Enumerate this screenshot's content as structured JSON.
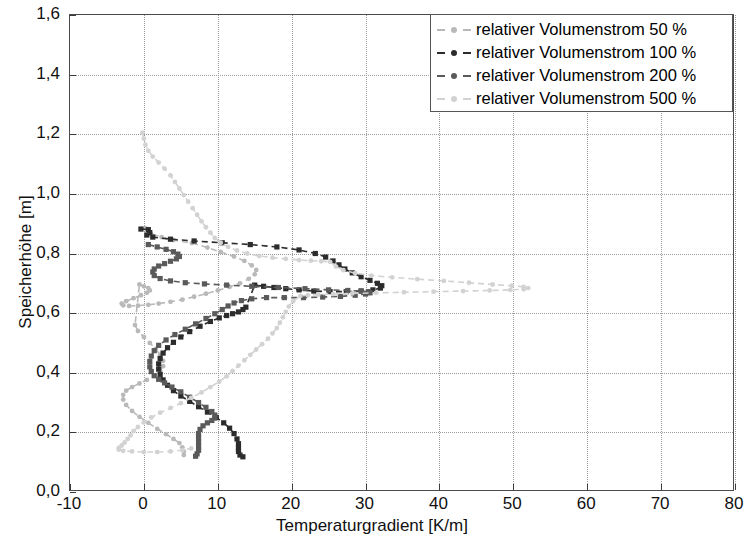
{
  "chart_data": {
    "type": "line",
    "title": "",
    "xlabel": "Temperaturgradient [K/m]",
    "ylabel": "Speicherhöhe [m]",
    "xlim": [
      -10,
      80
    ],
    "ylim": [
      0.0,
      1.6
    ],
    "xticks": [
      "-10",
      "0",
      "10",
      "20",
      "30",
      "40",
      "50",
      "60",
      "70",
      "80"
    ],
    "xtick_values": [
      -10,
      0,
      10,
      20,
      30,
      40,
      50,
      60,
      70,
      80
    ],
    "yticks": [
      "0,0",
      "0,2",
      "0,4",
      "0,6",
      "0,8",
      "1,0",
      "1,2",
      "1,4",
      "1,6"
    ],
    "ytick_values": [
      0.0,
      0.2,
      0.4,
      0.6,
      0.8,
      1.0,
      1.2,
      1.4,
      1.6
    ],
    "grid": true,
    "grid_style": "dotted",
    "legend_position": "top-right",
    "orientation": "x=temperature-gradient, y=storage-height",
    "series": [
      {
        "name": "relativer Volumenstrom 50 %",
        "color": "#b9b9b9",
        "marker": "dot",
        "linestyle": "dashed",
        "points": [
          [
            0.2,
            0.885
          ],
          [
            1.0,
            0.865
          ],
          [
            2.4,
            0.855
          ],
          [
            4.0,
            0.845
          ],
          [
            6.5,
            0.835
          ],
          [
            8.6,
            0.82
          ],
          [
            10.4,
            0.805
          ],
          [
            12.2,
            0.79
          ],
          [
            13.6,
            0.775
          ],
          [
            14.6,
            0.76
          ],
          [
            15.2,
            0.745
          ],
          [
            15.0,
            0.73
          ],
          [
            14.2,
            0.715
          ],
          [
            13.0,
            0.7
          ],
          [
            11.6,
            0.688
          ],
          [
            10.0,
            0.676
          ],
          [
            8.4,
            0.665
          ],
          [
            6.8,
            0.655
          ],
          [
            5.2,
            0.645
          ],
          [
            3.6,
            0.638
          ],
          [
            2.0,
            0.632
          ],
          [
            0.6,
            0.628
          ],
          [
            -0.8,
            0.625
          ],
          [
            -2.0,
            0.624
          ],
          [
            -2.8,
            0.626
          ],
          [
            -3.0,
            0.632
          ],
          [
            -2.4,
            0.64
          ],
          [
            -1.4,
            0.65
          ],
          [
            -0.4,
            0.66
          ],
          [
            0.4,
            0.668
          ],
          [
            0.8,
            0.676
          ],
          [
            0.6,
            0.684
          ],
          [
            0.0,
            0.69
          ],
          [
            -0.6,
            0.696
          ],
          [
            -1.2,
            0.56
          ],
          [
            -0.8,
            0.54
          ],
          [
            0.0,
            0.52
          ],
          [
            0.8,
            0.5
          ],
          [
            1.6,
            0.48
          ],
          [
            2.2,
            0.46
          ],
          [
            2.6,
            0.44
          ],
          [
            2.6,
            0.422
          ],
          [
            2.2,
            0.405
          ],
          [
            1.4,
            0.39
          ],
          [
            0.4,
            0.376
          ],
          [
            -0.6,
            0.364
          ],
          [
            -1.6,
            0.352
          ],
          [
            -2.4,
            0.34
          ],
          [
            -2.8,
            0.326
          ],
          [
            -2.8,
            0.31
          ],
          [
            -2.4,
            0.292
          ],
          [
            -1.6,
            0.272
          ],
          [
            -0.6,
            0.252
          ],
          [
            0.6,
            0.232
          ],
          [
            1.8,
            0.212
          ],
          [
            3.0,
            0.194
          ],
          [
            4.0,
            0.178
          ],
          [
            4.8,
            0.164
          ],
          [
            5.2,
            0.15
          ],
          [
            5.4,
            0.136
          ],
          [
            5.4,
            0.124
          ]
        ]
      },
      {
        "name": "relativer Volumenstrom 100 %",
        "color": "#2c2c2c",
        "marker": "square",
        "linestyle": "dashed",
        "points": [
          [
            -0.4,
            0.882
          ],
          [
            0.6,
            0.88
          ],
          [
            0.8,
            0.87
          ],
          [
            0.4,
            0.862
          ],
          [
            1.2,
            0.855
          ],
          [
            3.6,
            0.848
          ],
          [
            6.8,
            0.842
          ],
          [
            10.6,
            0.836
          ],
          [
            14.4,
            0.83
          ],
          [
            18.0,
            0.822
          ],
          [
            21.0,
            0.812
          ],
          [
            23.2,
            0.8
          ],
          [
            24.6,
            0.788
          ],
          [
            25.6,
            0.775
          ],
          [
            26.4,
            0.762
          ],
          [
            27.2,
            0.748
          ],
          [
            28.2,
            0.735
          ],
          [
            29.4,
            0.722
          ],
          [
            30.6,
            0.71
          ],
          [
            31.6,
            0.7
          ],
          [
            32.2,
            0.692
          ],
          [
            32.0,
            0.684
          ],
          [
            31.0,
            0.678
          ],
          [
            29.4,
            0.674
          ],
          [
            27.4,
            0.672
          ],
          [
            25.2,
            0.672
          ],
          [
            23.0,
            0.674
          ],
          [
            21.0,
            0.678
          ],
          [
            19.2,
            0.682
          ],
          [
            17.6,
            0.686
          ],
          [
            16.2,
            0.69
          ],
          [
            15.0,
            0.694
          ],
          [
            13.8,
            0.62
          ],
          [
            13.4,
            0.612
          ],
          [
            12.8,
            0.604
          ],
          [
            12.0,
            0.598
          ],
          [
            11.2,
            0.592
          ],
          [
            10.2,
            0.584
          ],
          [
            9.0,
            0.572
          ],
          [
            7.6,
            0.556
          ],
          [
            6.2,
            0.538
          ],
          [
            5.0,
            0.52
          ],
          [
            4.0,
            0.502
          ],
          [
            3.2,
            0.484
          ],
          [
            2.6,
            0.466
          ],
          [
            2.2,
            0.448
          ],
          [
            2.0,
            0.43
          ],
          [
            2.0,
            0.412
          ],
          [
            2.2,
            0.394
          ],
          [
            2.6,
            0.376
          ],
          [
            3.2,
            0.358
          ],
          [
            4.0,
            0.34
          ],
          [
            5.0,
            0.322
          ],
          [
            6.2,
            0.304
          ],
          [
            7.4,
            0.286
          ],
          [
            8.6,
            0.268
          ],
          [
            9.8,
            0.25
          ],
          [
            10.8,
            0.232
          ],
          [
            11.6,
            0.214
          ],
          [
            12.2,
            0.196
          ],
          [
            12.6,
            0.178
          ],
          [
            12.8,
            0.162
          ],
          [
            12.8,
            0.148
          ],
          [
            12.8,
            0.136
          ],
          [
            13.0,
            0.124
          ],
          [
            13.4,
            0.118
          ]
        ]
      },
      {
        "name": "relativer Volumenstrom 200 %",
        "color": "#5a5a5a",
        "marker": "square",
        "linestyle": "dashed",
        "points": [
          [
            0.6,
            0.83
          ],
          [
            1.8,
            0.822
          ],
          [
            3.0,
            0.814
          ],
          [
            4.0,
            0.806
          ],
          [
            4.6,
            0.798
          ],
          [
            4.8,
            0.79
          ],
          [
            4.4,
            0.782
          ],
          [
            3.6,
            0.774
          ],
          [
            2.8,
            0.766
          ],
          [
            2.0,
            0.758
          ],
          [
            1.4,
            0.748
          ],
          [
            1.2,
            0.738
          ],
          [
            1.4,
            0.726
          ],
          [
            2.2,
            0.716
          ],
          [
            3.6,
            0.708
          ],
          [
            5.6,
            0.702
          ],
          [
            8.2,
            0.698
          ],
          [
            11.2,
            0.694
          ],
          [
            14.6,
            0.69
          ],
          [
            18.2,
            0.686
          ],
          [
            21.8,
            0.682
          ],
          [
            25.0,
            0.678
          ],
          [
            27.6,
            0.676
          ],
          [
            29.4,
            0.674
          ],
          [
            30.4,
            0.672
          ],
          [
            30.6,
            0.668
          ],
          [
            30.0,
            0.664
          ],
          [
            28.6,
            0.66
          ],
          [
            26.6,
            0.656
          ],
          [
            24.2,
            0.654
          ],
          [
            21.6,
            0.652
          ],
          [
            19.0,
            0.652
          ],
          [
            16.6,
            0.652
          ],
          [
            14.6,
            0.648
          ],
          [
            13.2,
            0.642
          ],
          [
            12.2,
            0.634
          ],
          [
            11.4,
            0.624
          ],
          [
            10.6,
            0.612
          ],
          [
            9.6,
            0.598
          ],
          [
            8.4,
            0.582
          ],
          [
            7.0,
            0.564
          ],
          [
            5.6,
            0.546
          ],
          [
            4.2,
            0.528
          ],
          [
            3.0,
            0.51
          ],
          [
            2.0,
            0.492
          ],
          [
            1.4,
            0.474
          ],
          [
            1.0,
            0.456
          ],
          [
            0.8,
            0.438
          ],
          [
            0.8,
            0.42
          ],
          [
            1.0,
            0.404
          ],
          [
            1.4,
            0.39
          ],
          [
            2.0,
            0.378
          ],
          [
            2.8,
            0.366
          ],
          [
            3.8,
            0.352
          ],
          [
            5.0,
            0.336
          ],
          [
            6.2,
            0.318
          ],
          [
            7.4,
            0.3
          ],
          [
            8.4,
            0.284
          ],
          [
            9.2,
            0.27
          ],
          [
            9.6,
            0.258
          ],
          [
            9.6,
            0.248
          ],
          [
            9.2,
            0.24
          ],
          [
            8.6,
            0.232
          ],
          [
            8.0,
            0.222
          ],
          [
            7.6,
            0.21
          ],
          [
            7.4,
            0.196
          ],
          [
            7.4,
            0.182
          ],
          [
            7.4,
            0.168
          ],
          [
            7.4,
            0.154
          ],
          [
            7.4,
            0.14
          ],
          [
            7.2,
            0.128
          ],
          [
            7.0,
            0.12
          ]
        ]
      },
      {
        "name": "relativer Volumenstrom 500 %",
        "color": "#d2d2d2",
        "marker": "dot",
        "linestyle": "dashed",
        "points": [
          [
            -0.2,
            1.205
          ],
          [
            0.0,
            1.185
          ],
          [
            0.2,
            1.165
          ],
          [
            0.6,
            1.145
          ],
          [
            1.2,
            1.125
          ],
          [
            2.0,
            1.105
          ],
          [
            2.8,
            1.085
          ],
          [
            3.6,
            1.062
          ],
          [
            4.2,
            1.04
          ],
          [
            4.8,
            1.018
          ],
          [
            5.4,
            0.996
          ],
          [
            6.0,
            0.974
          ],
          [
            6.6,
            0.952
          ],
          [
            7.2,
            0.93
          ],
          [
            7.8,
            0.908
          ],
          [
            8.4,
            0.888
          ],
          [
            9.0,
            0.87
          ],
          [
            9.6,
            0.852
          ],
          [
            10.4,
            0.836
          ],
          [
            11.4,
            0.822
          ],
          [
            12.6,
            0.81
          ],
          [
            14.0,
            0.8
          ],
          [
            15.6,
            0.792
          ],
          [
            17.4,
            0.786
          ],
          [
            19.2,
            0.782
          ],
          [
            21.0,
            0.778
          ],
          [
            22.6,
            0.776
          ],
          [
            24.0,
            0.774
          ],
          [
            25.2,
            0.772
          ],
          [
            26.0,
            0.756
          ],
          [
            27.0,
            0.744
          ],
          [
            28.6,
            0.734
          ],
          [
            30.8,
            0.726
          ],
          [
            33.6,
            0.72
          ],
          [
            37.0,
            0.714
          ],
          [
            40.6,
            0.708
          ],
          [
            44.0,
            0.702
          ],
          [
            47.2,
            0.696
          ],
          [
            49.8,
            0.692
          ],
          [
            51.4,
            0.688
          ],
          [
            52.0,
            0.684
          ],
          [
            51.4,
            0.68
          ],
          [
            49.6,
            0.678
          ],
          [
            46.8,
            0.676
          ],
          [
            43.2,
            0.674
          ],
          [
            39.2,
            0.672
          ],
          [
            35.2,
            0.67
          ],
          [
            31.4,
            0.668
          ],
          [
            28.2,
            0.666
          ],
          [
            25.6,
            0.664
          ],
          [
            23.6,
            0.662
          ],
          [
            22.2,
            0.66
          ],
          [
            21.2,
            0.658
          ],
          [
            20.2,
            0.64
          ],
          [
            19.6,
            0.622
          ],
          [
            19.2,
            0.604
          ],
          [
            18.8,
            0.586
          ],
          [
            18.4,
            0.568
          ],
          [
            18.0,
            0.55
          ],
          [
            17.4,
            0.532
          ],
          [
            16.8,
            0.514
          ],
          [
            16.0,
            0.496
          ],
          [
            15.2,
            0.478
          ],
          [
            14.4,
            0.46
          ],
          [
            13.6,
            0.442
          ],
          [
            12.8,
            0.424
          ],
          [
            12.0,
            0.406
          ],
          [
            11.2,
            0.388
          ],
          [
            10.2,
            0.37
          ],
          [
            9.0,
            0.352
          ],
          [
            7.8,
            0.334
          ],
          [
            6.4,
            0.316
          ],
          [
            5.0,
            0.298
          ],
          [
            3.6,
            0.282
          ],
          [
            2.2,
            0.266
          ],
          [
            1.0,
            0.25
          ],
          [
            0.0,
            0.234
          ],
          [
            -0.8,
            0.218
          ],
          [
            -1.4,
            0.204
          ],
          [
            -1.8,
            0.19
          ],
          [
            -2.2,
            0.178
          ],
          [
            -2.6,
            0.166
          ],
          [
            -3.0,
            0.156
          ],
          [
            -3.4,
            0.148
          ],
          [
            -3.4,
            0.142
          ],
          [
            -2.8,
            0.138
          ],
          [
            -1.6,
            0.136
          ],
          [
            0.0,
            0.134
          ],
          [
            1.8,
            0.134
          ],
          [
            3.6,
            0.136
          ],
          [
            5.2,
            0.14
          ],
          [
            6.4,
            0.146
          ]
        ]
      }
    ]
  },
  "legend": {
    "entries": [
      {
        "label": "relativer Volumenstrom 50 %",
        "color": "#b9b9b9"
      },
      {
        "label": "relativer Volumenstrom 100 %",
        "color": "#2c2c2c"
      },
      {
        "label": "relativer Volumenstrom 200 %",
        "color": "#5a5a5a"
      },
      {
        "label": "relativer Volumenstrom 500 %",
        "color": "#d2d2d2"
      }
    ]
  }
}
